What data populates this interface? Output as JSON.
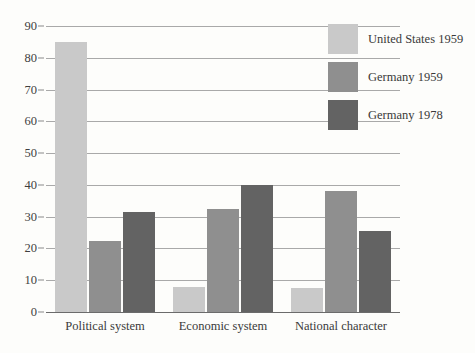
{
  "chart_data": {
    "type": "bar",
    "title": "",
    "subtitle": "",
    "xlabel": "",
    "ylabel": "",
    "categories": [
      "Political system",
      "Economic system",
      "National character"
    ],
    "series": [
      {
        "name": "United States 1959",
        "color": "#c9c9c9",
        "values": [
          85,
          8,
          7.5
        ]
      },
      {
        "name": "Germany 1959",
        "color": "#8f8f8f",
        "values": [
          22.5,
          32.5,
          38
        ]
      },
      {
        "name": "Germany 1978",
        "color": "#636363",
        "values": [
          31.5,
          40,
          25.5
        ]
      }
    ],
    "ylim": [
      0,
      90
    ],
    "yticks": [
      0,
      10,
      20,
      30,
      40,
      50,
      60,
      70,
      80,
      90
    ],
    "ytick_labels": [
      "0",
      "10",
      "20",
      "30",
      "40",
      "50",
      "60",
      "70",
      "80",
      "90"
    ],
    "grid": "horizontal",
    "legend_position": "top-right",
    "grouping": "grouped",
    "background_color": "#fdfdfb",
    "gridline_color": "#a9a9a9",
    "axis_color": "#6b6b6b"
  },
  "legend": {
    "entries": [
      {
        "label": "United States 1959",
        "color": "#c9c9c9"
      },
      {
        "label": "Germany 1959",
        "color": "#8f8f8f"
      },
      {
        "label": "Germany 1978",
        "color": "#636363"
      }
    ]
  }
}
